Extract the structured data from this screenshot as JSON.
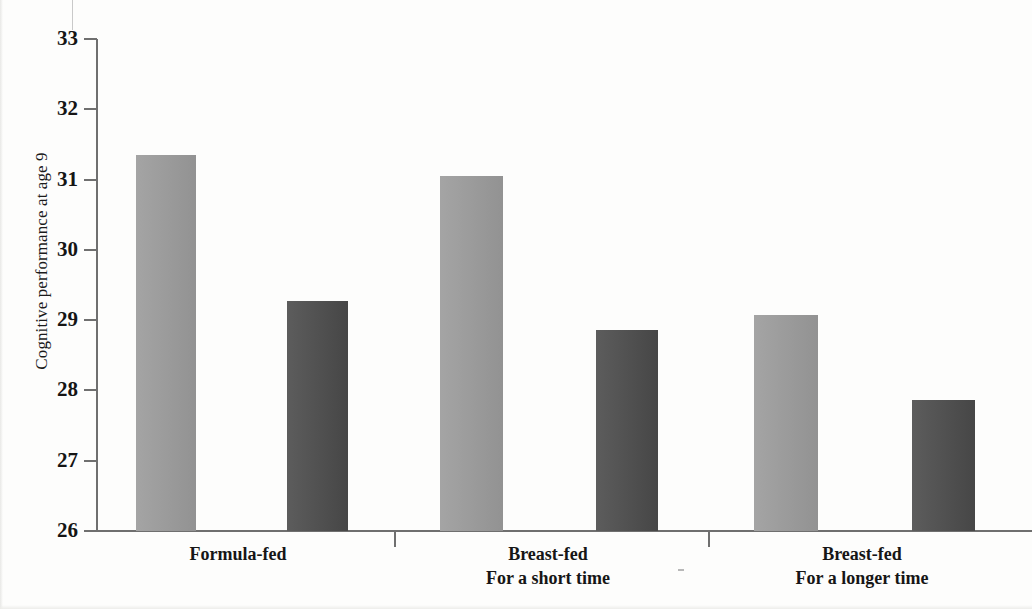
{
  "chart_data": {
    "type": "bar",
    "title": "",
    "xlabel": "",
    "ylabel": "Cognitive performance at age 9",
    "ylim": [
      26,
      33
    ],
    "yticks": [
      26,
      27,
      28,
      29,
      30,
      31,
      32,
      33
    ],
    "ytick_labels": [
      "26",
      "27",
      "28",
      "29",
      "30",
      "31",
      "32",
      "33"
    ],
    "grid": false,
    "legend": "none",
    "categories": [
      "Formula-fed",
      "Breast-fed\nFor a short time",
      "Breast-fed\nFor a longer time"
    ],
    "category_lines": [
      [
        "Formula-fed"
      ],
      [
        "Breast-fed",
        "For a short time"
      ],
      [
        "Breast-fed",
        "For a longer time"
      ]
    ],
    "series": [
      {
        "name": "light-gray-series",
        "color": "#9a9a9a",
        "values": [
          31.35,
          31.05,
          29.08
        ]
      },
      {
        "name": "dark-gray-series",
        "color": "#4a4a4a",
        "values": [
          29.27,
          28.86,
          27.87
        ]
      }
    ],
    "bars": [
      {
        "group": 0,
        "series": 0,
        "value": 31.35,
        "left": 136,
        "width": 60
      },
      {
        "group": 0,
        "series": 1,
        "value": 29.27,
        "left": 287,
        "width": 61
      },
      {
        "group": 1,
        "series": 0,
        "value": 31.05,
        "left": 440,
        "width": 63
      },
      {
        "group": 1,
        "series": 1,
        "value": 28.86,
        "left": 596,
        "width": 62
      },
      {
        "group": 2,
        "series": 0,
        "value": 29.08,
        "left": 754,
        "width": 64
      },
      {
        "group": 2,
        "series": 1,
        "value": 27.87,
        "left": 912,
        "width": 63
      }
    ],
    "group_separators": [
      394,
      708
    ],
    "group_label_centers": [
      238,
      548,
      862
    ]
  },
  "axis": {
    "y_title": "Cognitive performance at age 9"
  }
}
